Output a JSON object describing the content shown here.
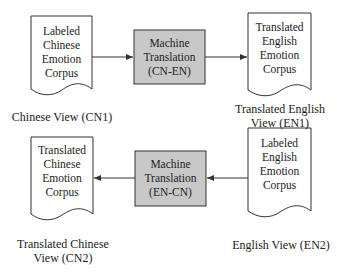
{
  "diagram": {
    "nodes": {
      "doc_cn1": {
        "lines": [
          "Labeled",
          "Chinese",
          "Emotion",
          "Corpus"
        ],
        "shape": "document"
      },
      "mt_cn_en": {
        "lines": [
          "Machine",
          "Translation",
          "(CN-EN)"
        ],
        "shape": "process",
        "fill": "#c8c8c8"
      },
      "doc_en1": {
        "lines": [
          "Translated",
          "English",
          "Emotion",
          "Corpus"
        ],
        "shape": "document"
      },
      "doc_cn2": {
        "lines": [
          "Translated",
          "Chinese",
          "Emotion",
          "Corpus"
        ],
        "shape": "document"
      },
      "mt_en_cn": {
        "lines": [
          "Machine",
          "Translation",
          "(EN-CN)"
        ],
        "shape": "process",
        "fill": "#c8c8c8"
      },
      "doc_en2": {
        "lines": [
          "Labeled",
          "English",
          "Emotion",
          "Corpus"
        ],
        "shape": "document"
      }
    },
    "captions": {
      "cn1": {
        "lines": [
          "Chinese View (CN1)"
        ]
      },
      "en1": {
        "lines": [
          "Translated English",
          "View (EN1)"
        ]
      },
      "cn2": {
        "lines": [
          "Translated Chinese",
          "View (CN2)"
        ]
      },
      "en2": {
        "lines": [
          "English View (EN2)"
        ]
      }
    },
    "edges": [
      {
        "from": "doc_cn1",
        "to": "mt_cn_en"
      },
      {
        "from": "mt_cn_en",
        "to": "doc_en1"
      },
      {
        "from": "doc_en2",
        "to": "mt_en_cn"
      },
      {
        "from": "mt_en_cn",
        "to": "doc_cn2"
      }
    ],
    "colors": {
      "stroke": "#333333",
      "process_fill": "#c8c8c8",
      "background": "#ffffff"
    }
  }
}
